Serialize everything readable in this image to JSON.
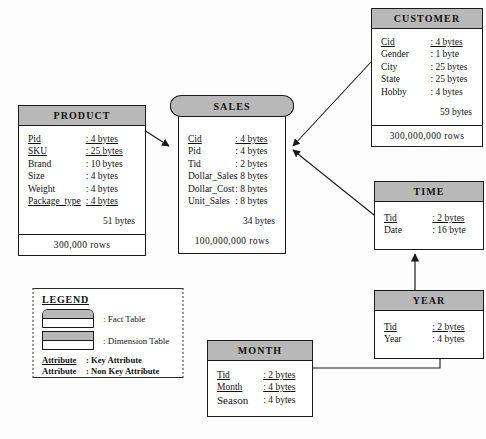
{
  "diagram": {
    "colors": {
      "header_fill": "#b8b8b8",
      "body_fill": "#ffffff",
      "line": "#1a1a1a"
    }
  },
  "entities": {
    "product": {
      "name": "PRODUCT",
      "type": "dimension",
      "attributes": [
        {
          "name": "Pid",
          "value": ": 4 bytes",
          "key": true
        },
        {
          "name": "SKU",
          "value": ": 25 bytes",
          "key": true
        },
        {
          "name": "Brand",
          "value": ": 10 bytes",
          "key": false
        },
        {
          "name": "Size",
          "value": ": 4 bytes",
          "key": false
        },
        {
          "name": "Weight",
          "value": ": 4 bytes",
          "key": false
        },
        {
          "name": "Package_type",
          "value": ": 4 bytes",
          "key": true
        }
      ],
      "total_bytes": "51 bytes",
      "rows": "300,000 rows"
    },
    "sales": {
      "name": "SALES",
      "type": "fact",
      "attributes": [
        {
          "name": "Cid",
          "value": ": 4 bytes",
          "key": true
        },
        {
          "name": "Pid",
          "value": ": 4 bytes",
          "key": false
        },
        {
          "name": "Tid",
          "value": ": 2 bytes",
          "key": false
        },
        {
          "name": "Dollar_Sales",
          "value": ": 8 bytes",
          "key": false
        },
        {
          "name": "Dollar_Cost",
          "value": ": 8 bytes",
          "key": false
        },
        {
          "name": "Unit_Sales",
          "value": ": 8 bytes",
          "key": false
        }
      ],
      "total_bytes": "34 bytes",
      "rows": "100,000,000 rows"
    },
    "customer": {
      "name": "CUSTOMER",
      "type": "dimension",
      "attributes": [
        {
          "name": "Cid",
          "value": ": 4 bytes",
          "key": true
        },
        {
          "name": "Gender",
          "value": ": 1 byte",
          "key": false
        },
        {
          "name": "City",
          "value": ": 25 bytes",
          "key": false
        },
        {
          "name": "State",
          "value": ": 25 bytes",
          "key": false
        },
        {
          "name": "Hobby",
          "value": ": 4 bytes",
          "key": false
        }
      ],
      "total_bytes": "59 bytes",
      "rows": "300,000,000 rows"
    },
    "time": {
      "name": "TIME",
      "type": "dimension",
      "attributes": [
        {
          "name": "Tid",
          "value": ": 2 bytes",
          "key": true
        },
        {
          "name": "Date",
          "value": ": 16 byte",
          "key": false
        }
      ]
    },
    "year": {
      "name": "YEAR",
      "type": "dimension",
      "attributes": [
        {
          "name": "Tid",
          "value": ": 2 bytes",
          "key": true
        },
        {
          "name": "Year",
          "value": ": 4 bytes",
          "key": false
        }
      ]
    },
    "month": {
      "name": "MONTH",
      "type": "dimension",
      "attributes": [
        {
          "name": "Tid",
          "value": ": 2 bytes",
          "key": true
        },
        {
          "name": "Month",
          "value": ": 4 bytes",
          "key": true
        },
        {
          "name": "Season",
          "value": ": 4 bytes",
          "key": false
        }
      ]
    }
  },
  "legend": {
    "title": "LEGEND",
    "fact_label": ": Fact Table",
    "dimension_label": ": Dimension Table",
    "key_attr_name": "Attribute",
    "key_attr_desc": ": Key Attribute",
    "nonkey_attr_name": "Attribute",
    "nonkey_attr_desc": ": Non Key Attribute"
  }
}
